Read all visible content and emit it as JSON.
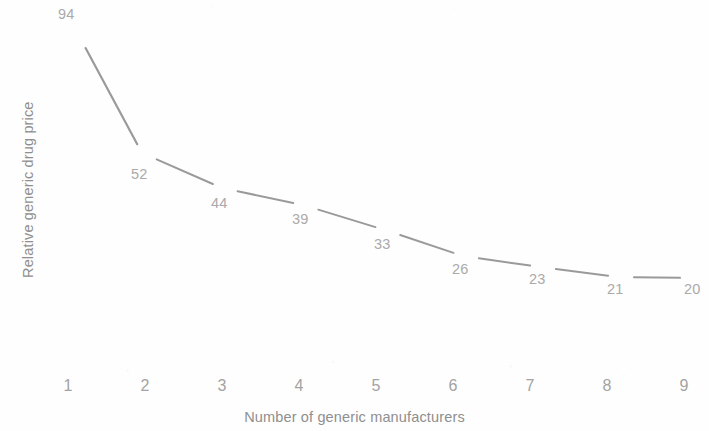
{
  "chart_data": {
    "type": "line",
    "title": "",
    "subtitle": "",
    "xlabel": "Number of generic manufacturers",
    "ylabel": "Relative generic drug price",
    "categories": [
      1,
      2,
      3,
      4,
      5,
      6,
      7,
      8,
      9
    ],
    "x_tick_labels": [
      "1",
      "2",
      "3",
      "4",
      "5",
      "6",
      "7",
      "8",
      "9"
    ],
    "values": [
      94,
      52,
      44,
      39,
      33,
      26,
      23,
      21,
      20
    ],
    "data_labels": [
      "94",
      "52",
      "44",
      "39",
      "33",
      "26",
      "23",
      "21",
      "20"
    ],
    "series": [
      {
        "name": "Relative generic drug price",
        "values": [
          94,
          52,
          44,
          39,
          33,
          26,
          23,
          21,
          20
        ]
      }
    ],
    "xlim": [
      1,
      9
    ],
    "ylim": [
      0,
      100
    ],
    "grid": false,
    "legend": false,
    "legend_position": "none",
    "show_markers": false,
    "y_tick_labels": [],
    "annotations": [],
    "colors": {
      "line": "#9a9a9a",
      "data_label": "#aaaaaa",
      "axis_title": "#8f8f8f",
      "tick_label": "#a3a3a3",
      "background": "#fefefe"
    },
    "point_geometry": [
      {
        "label": "94",
        "label_x": 58,
        "label_y": 7,
        "px": 78,
        "py": 34
      },
      {
        "label": "52",
        "label_x": 131,
        "label_y": 167,
        "px": 142,
        "py": 153
      },
      {
        "label": "44",
        "label_x": 211,
        "label_y": 196,
        "px": 222,
        "py": 188
      },
      {
        "label": "39",
        "label_x": 292,
        "label_y": 212,
        "px": 303,
        "py": 205
      },
      {
        "label": "33",
        "label_x": 374,
        "label_y": 237,
        "px": 385,
        "py": 230
      },
      {
        "label": "26",
        "label_x": 452,
        "label_y": 262,
        "px": 463,
        "py": 256
      },
      {
        "label": "23",
        "label_x": 529,
        "label_y": 272,
        "px": 540,
        "py": 267
      },
      {
        "label": "21",
        "label_x": 607,
        "label_y": 282,
        "px": 618,
        "py": 277
      },
      {
        "label": "20",
        "label_x": 684,
        "label_y": 282,
        "px": 690,
        "py": 278
      }
    ],
    "x_tick_geometry": [
      68,
      145,
      222,
      299,
      376,
      453,
      530,
      607,
      684
    ]
  }
}
